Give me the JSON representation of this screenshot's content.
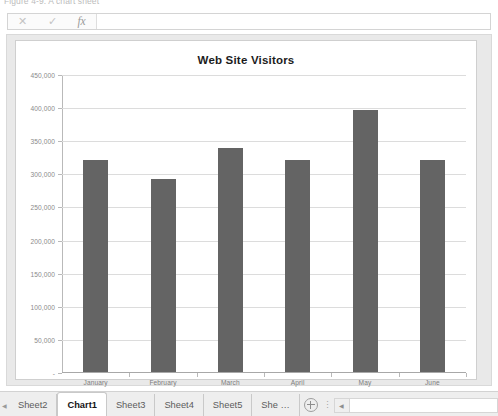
{
  "top_caption": "Figure 4-9: A chart sheet",
  "formula_bar": {
    "cancel_icon": "close-icon",
    "cancel_label": "✕",
    "enter_icon": "check-icon",
    "enter_label": "✓",
    "function_icon": "insert-function-icon",
    "function_label": "fx",
    "value": "",
    "placeholder": ""
  },
  "chart_data": {
    "type": "bar",
    "title": "Web Site Visitors",
    "xlabel": "",
    "ylabel": "",
    "categories": [
      "January",
      "February",
      "March",
      "April",
      "May",
      "June"
    ],
    "values": [
      320000,
      292000,
      339000,
      320000,
      396000,
      320000
    ],
    "ylim": [
      0,
      450000
    ],
    "ytick_values": [
      0,
      50000,
      100000,
      150000,
      200000,
      250000,
      300000,
      350000,
      400000,
      450000
    ],
    "ytick_labels": [
      "-",
      "50,000",
      "100,000",
      "150,000",
      "200,000",
      "250,000",
      "300,000",
      "350,000",
      "400,000",
      "450,000"
    ],
    "grid": true,
    "legend": false,
    "bar_color": "#646464",
    "plot_background": "#ffffff"
  },
  "tabbar": {
    "scroll_left_icon": "chevron-left-icon",
    "scroll_left_label": "◀",
    "tabs": [
      {
        "label": "Sheet2",
        "active": false
      },
      {
        "label": "Chart1",
        "active": true
      },
      {
        "label": "Sheet3",
        "active": false
      },
      {
        "label": "Sheet4",
        "active": false
      },
      {
        "label": "Sheet5",
        "active": false
      },
      {
        "label": "She …",
        "active": false
      }
    ],
    "add_sheet_icon": "plus-circle-icon",
    "grip_icon": "vertical-dots-icon",
    "grip_label": "⋮",
    "hscroll_left_icon": "scroll-left-arrow-icon",
    "hscroll_left_label": "◀"
  }
}
